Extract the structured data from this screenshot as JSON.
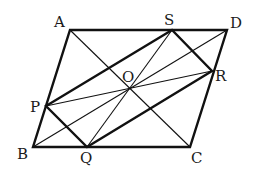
{
  "figure": {
    "stroke_color": "#111111",
    "background": "#ffffff"
  },
  "points": {
    "A": {
      "label": "A",
      "x": 70,
      "y": 30
    },
    "D": {
      "label": "D",
      "x": 227,
      "y": 30
    },
    "B": {
      "label": "B",
      "x": 33,
      "y": 147
    },
    "C": {
      "label": "C",
      "x": 190,
      "y": 147
    },
    "S": {
      "label": "S",
      "x": 172,
      "y": 30
    },
    "R": {
      "label": "R",
      "x": 212,
      "y": 71
    },
    "P": {
      "label": "P",
      "x": 46,
      "y": 106
    },
    "Q": {
      "label": "Q",
      "x": 87,
      "y": 147
    },
    "O": {
      "label": "O",
      "x": 129,
      "y": 88
    }
  },
  "segments": {
    "thick": [
      "AD",
      "DC",
      "CB",
      "BA",
      "PS",
      "SR",
      "RQ",
      "QP"
    ],
    "thin": [
      "AC",
      "BD",
      "PR",
      "QS"
    ]
  }
}
